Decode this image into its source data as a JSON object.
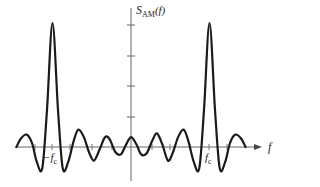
{
  "chart_data": {
    "type": "line",
    "title": "",
    "ylabel": "S_AM(f)",
    "ylabel_main": "S",
    "ylabel_sub": "AM",
    "ylabel_arg": "(f)",
    "xlabel": "f",
    "x_tick_labels": [
      {
        "label": "−f",
        "sub": "c",
        "x": -1
      },
      {
        "label": "f",
        "sub": "c",
        "x": 1
      }
    ],
    "series": [
      {
        "name": "S_AM(f)",
        "x": [
          -1.46,
          -1.4,
          -1.33,
          -1.26,
          -1.2,
          -1.13,
          -1.07,
          -1.0,
          -0.93,
          -0.87,
          -0.8,
          -0.73,
          -0.67,
          -0.6,
          -0.53,
          -0.47,
          -0.4,
          -0.33,
          -0.27,
          -0.2,
          -0.13,
          -0.07,
          0.0,
          0.07,
          0.13,
          0.2,
          0.27,
          0.33,
          0.4,
          0.47,
          0.53,
          0.6,
          0.67,
          0.73,
          0.8,
          0.87,
          0.93,
          1.0,
          1.07,
          1.13,
          1.2,
          1.26,
          1.33,
          1.4,
          1.46
        ],
        "y": [
          0.0,
          0.07,
          0.1,
          0.03,
          -0.12,
          -0.17,
          0.3,
          1.0,
          0.3,
          -0.17,
          -0.12,
          0.05,
          0.14,
          0.08,
          -0.05,
          -0.11,
          -0.02,
          0.08,
          0.06,
          -0.04,
          -0.06,
          0.01,
          0.08,
          0.02,
          -0.06,
          -0.05,
          0.05,
          0.11,
          0.02,
          -0.11,
          -0.05,
          0.08,
          0.14,
          0.05,
          -0.12,
          -0.17,
          0.3,
          1.0,
          0.3,
          -0.17,
          -0.12,
          0.03,
          0.1,
          0.07,
          0.0
        ]
      }
    ],
    "y_ticks_count": 4,
    "axis_color": "#555555",
    "curve_color": "#1a1a1a"
  }
}
